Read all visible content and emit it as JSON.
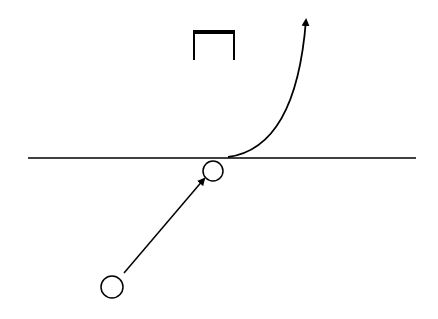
{
  "diagram": {
    "width": 438,
    "height": 319,
    "background": "#ffffff",
    "stroke_color": "#000000",
    "baseline": {
      "x1": 28,
      "y1": 158,
      "x2": 416,
      "y2": 158,
      "stroke_width": 1.5
    },
    "bracket": {
      "x1": 194,
      "x2": 234,
      "top_y": 32,
      "bottom_y": 60,
      "top_stroke_width": 4,
      "leg_stroke_width": 2
    },
    "circles": [
      {
        "id": "upper",
        "cx": 213,
        "cy": 171,
        "r": 10,
        "stroke_width": 1.5
      },
      {
        "id": "lower",
        "cx": 112,
        "cy": 287,
        "r": 11,
        "stroke_width": 1.5
      }
    ],
    "straight_arrow": {
      "x1": 124,
      "y1": 273,
      "x2": 204,
      "y2": 179,
      "stroke_width": 1.5
    },
    "curved_arrow": {
      "start": {
        "x": 228,
        "y": 157
      },
      "control": {
        "x": 296,
        "y": 148
      },
      "end": {
        "x": 306,
        "y": 20
      },
      "stroke_width": 1.8
    }
  }
}
